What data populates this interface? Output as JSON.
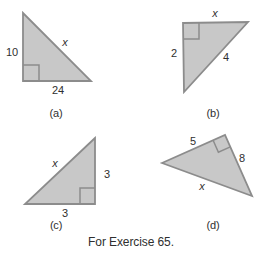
{
  "figure": {
    "caption": "For Exercise 65.",
    "triangles": [
      {
        "label": "(a)",
        "right_angle": "bottom-left",
        "sides": {
          "left": "10",
          "hypotenuse": "x",
          "bottom": "24"
        }
      },
      {
        "label": "(b)",
        "right_angle": "top-left",
        "sides": {
          "top": "x",
          "left": "2",
          "hypotenuse": "4"
        }
      },
      {
        "label": "(c)",
        "right_angle": "bottom-right",
        "sides": {
          "hypotenuse": "x",
          "right": "3",
          "bottom": "3"
        }
      },
      {
        "label": "(d)",
        "right_angle": "top",
        "sides": {
          "top": "5",
          "right": "8",
          "bottom": "x"
        }
      }
    ]
  },
  "colors": {
    "triangle_fill": "#c8c8c8",
    "triangle_stroke": "#8c8c8c",
    "label_text": "#2f2f2f",
    "background": "#ffffff"
  }
}
